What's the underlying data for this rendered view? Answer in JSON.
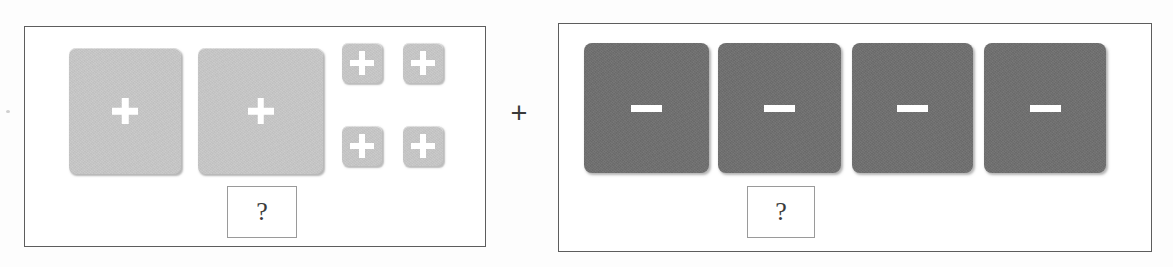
{
  "figure": {
    "operator_symbol": "+",
    "background_color": "#fdfdfd"
  },
  "panels": [
    {
      "id": "left-panel",
      "label": "positive-charges-panel",
      "frame_color": "#5d5d5d",
      "answer_box": {
        "text": "?",
        "border_color": "#9a9a9a"
      },
      "tiles": [
        {
          "id": "light-large-1",
          "symbol": "+",
          "size": "large",
          "fill": "#c7c7c7",
          "symbol_color": "#ffffff"
        },
        {
          "id": "light-large-2",
          "symbol": "+",
          "size": "large",
          "fill": "#c7c7c7",
          "symbol_color": "#ffffff"
        },
        {
          "id": "light-small-1",
          "symbol": "+",
          "size": "small",
          "fill": "#c7c7c7",
          "symbol_color": "#ffffff"
        },
        {
          "id": "light-small-2",
          "symbol": "+",
          "size": "small",
          "fill": "#c7c7c7",
          "symbol_color": "#ffffff"
        },
        {
          "id": "light-small-3",
          "symbol": "+",
          "size": "small",
          "fill": "#c7c7c7",
          "symbol_color": "#ffffff"
        },
        {
          "id": "light-small-4",
          "symbol": "+",
          "size": "small",
          "fill": "#c7c7c7",
          "symbol_color": "#ffffff"
        }
      ]
    },
    {
      "id": "right-panel",
      "label": "negative-charges-panel",
      "frame_color": "#5d5d5d",
      "answer_box": {
        "text": "?",
        "border_color": "#9a9a9a"
      },
      "tiles": [
        {
          "id": "dark-1",
          "symbol": "−",
          "size": "large",
          "fill": "#6e6e6e",
          "symbol_color": "#ffffff"
        },
        {
          "id": "dark-2",
          "symbol": "−",
          "size": "large",
          "fill": "#6e6e6e",
          "symbol_color": "#ffffff"
        },
        {
          "id": "dark-3",
          "symbol": "−",
          "size": "large",
          "fill": "#6e6e6e",
          "symbol_color": "#ffffff"
        },
        {
          "id": "dark-4",
          "symbol": "−",
          "size": "large",
          "fill": "#6e6e6e",
          "symbol_color": "#ffffff"
        }
      ]
    }
  ]
}
